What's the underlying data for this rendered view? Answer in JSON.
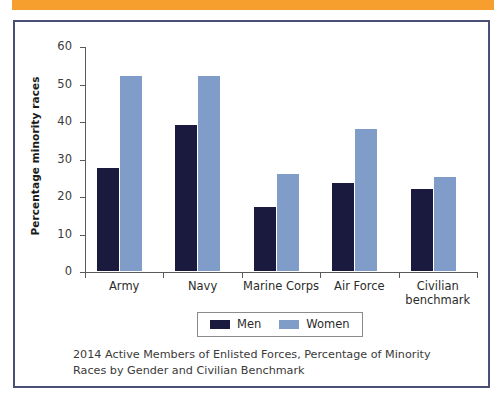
{
  "banner": {
    "color": "#f79f2e"
  },
  "frame": {
    "border_color": "#4a4f75"
  },
  "legend": {
    "position": "bottom-center",
    "items": [
      {
        "label": "Men",
        "color": "#191a3d"
      },
      {
        "label": "Women",
        "color": "#7f9dc8"
      }
    ]
  },
  "caption": {
    "text": "2014 Active Members of Enlisted Forces, Percentage of Minority Races by Gender and Civilian Benchmark"
  },
  "chart_data": {
    "type": "bar",
    "title": "",
    "subtitle": "",
    "xlabel": "",
    "ylabel": "Percentage minority races",
    "ylim": [
      0,
      60
    ],
    "yticks": [
      0,
      10,
      20,
      30,
      40,
      50,
      60
    ],
    "ytick_labels": [
      "0",
      "10",
      "20",
      "30",
      "40",
      "50",
      "60"
    ],
    "grid": false,
    "legend_position": "bottom",
    "categories": [
      "Army",
      "Navy",
      "Marine Corps",
      "Air Force",
      "Civilian benchmark"
    ],
    "category_labels": [
      "Army",
      "Navy",
      "Marine Corps",
      "Air Force",
      "Civilian\nbenchmark"
    ],
    "series": [
      {
        "name": "Men",
        "color": "#191a3d",
        "values": [
          27.5,
          39,
          17,
          23.5,
          22
        ]
      },
      {
        "name": "Women",
        "color": "#7f9dc8",
        "values": [
          52,
          52,
          26,
          38,
          25
        ]
      }
    ]
  }
}
